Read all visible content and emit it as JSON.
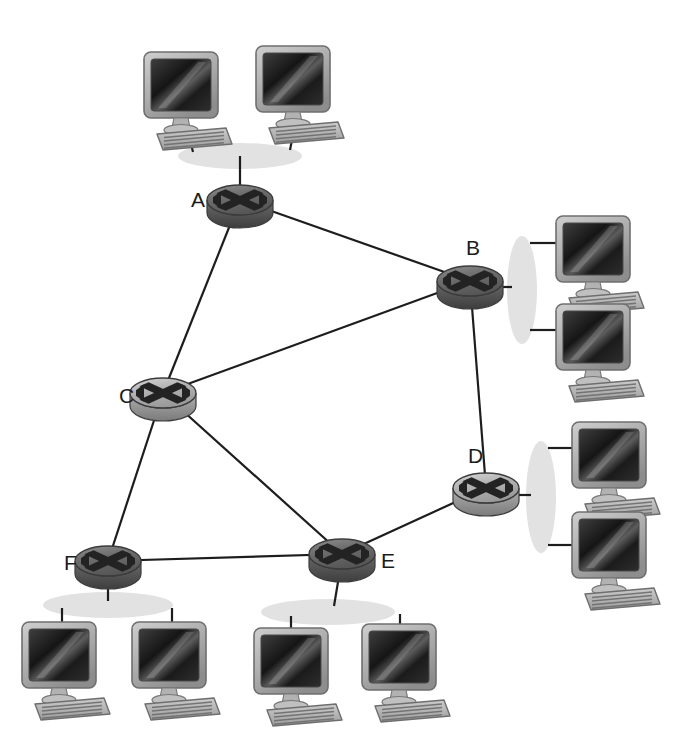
{
  "diagram": {
    "type": "network-topology",
    "background_color": "#ffffff",
    "link_color": "#1d1d1d",
    "link_width": 2.2,
    "label_color": "#1c1c1c",
    "label_font_size": 21,
    "router": {
      "icon_name": "router-icon",
      "top_fill_light": "#c9c9c9",
      "top_fill_dark": "#6f6f6f",
      "side_fill": "#5a5a5a",
      "edge_stroke": "#3b3b3b",
      "cross_color": "#232323",
      "rx": 33,
      "ry": 15,
      "body_height": 13
    },
    "lan": {
      "icon_name": "lan-segment-ellipse",
      "fill": "#e2e2e2",
      "stroke": "none"
    },
    "computer": {
      "icon_name": "desktop-computer-icon",
      "screen_dark": "#1a1a1a",
      "screen_light": "#4a4a4a",
      "bezel": "#b8b8b8",
      "bezel_edge": "#7d7d7d",
      "keyboard": "#bdbdbd",
      "keyboard_line": "#6a6a6a",
      "stand": "#a8a8a8"
    }
  },
  "routers": [
    {
      "id": "A",
      "label": "A",
      "cx": 240,
      "cy": 200,
      "label_x": 191,
      "label_y": 207,
      "tone": "dark"
    },
    {
      "id": "B",
      "label": "B",
      "cx": 470,
      "cy": 281,
      "label_x": 466,
      "label_y": 255,
      "tone": "dark"
    },
    {
      "id": "C",
      "label": "C",
      "cx": 163,
      "cy": 393,
      "label_x": 119,
      "label_y": 403,
      "tone": "light"
    },
    {
      "id": "D",
      "label": "D",
      "cx": 486,
      "cy": 488,
      "label_x": 468,
      "label_y": 463,
      "tone": "light"
    },
    {
      "id": "E",
      "label": "E",
      "cx": 342,
      "cy": 554,
      "label_x": 381,
      "label_y": 568,
      "tone": "dark"
    },
    {
      "id": "F",
      "label": "F",
      "cx": 108,
      "cy": 561,
      "label_x": 64,
      "label_y": 570,
      "tone": "dark"
    }
  ],
  "links": [
    {
      "from": "A",
      "to": "B",
      "name": "link-a-b"
    },
    {
      "from": "A",
      "to": "C",
      "name": "link-a-c"
    },
    {
      "from": "C",
      "to": "B",
      "name": "link-c-b"
    },
    {
      "from": "C",
      "to": "F",
      "name": "link-c-f"
    },
    {
      "from": "C",
      "to": "E",
      "name": "link-c-e"
    },
    {
      "from": "F",
      "to": "E",
      "name": "link-f-e"
    },
    {
      "from": "E",
      "to": "D",
      "name": "link-e-d"
    },
    {
      "from": "D",
      "to": "B",
      "name": "link-d-b"
    }
  ],
  "lan_segments": [
    {
      "id": "lan-a",
      "attached_router": "A",
      "orientation": "horizontal",
      "cx": 240,
      "cy": 156,
      "rx": 62,
      "ry": 13,
      "router_stub": {
        "x1": 240,
        "y1": 156,
        "x2": 240,
        "y2": 186
      },
      "hosts": [
        {
          "id": "pc-a-1",
          "x": 140,
          "y": 48,
          "stub": {
            "x1": 185,
            "y1": 120,
            "x2": 193,
            "y2": 152
          }
        },
        {
          "id": "pc-a-2",
          "x": 252,
          "y": 42,
          "stub": {
            "x1": 297,
            "y1": 114,
            "x2": 290,
            "y2": 150
          }
        }
      ]
    },
    {
      "id": "lan-b",
      "attached_router": "B",
      "orientation": "vertical",
      "cx": 522,
      "cy": 290,
      "rx": 15,
      "ry": 54,
      "router_stub": {
        "x1": 503,
        "y1": 287,
        "x2": 512,
        "y2": 287
      },
      "hosts": [
        {
          "id": "pc-b-1",
          "x": 552,
          "y": 212,
          "stub": {
            "x1": 530,
            "y1": 243,
            "x2": 556,
            "y2": 243
          }
        },
        {
          "id": "pc-b-2",
          "x": 552,
          "y": 300,
          "stub": {
            "x1": 530,
            "y1": 330,
            "x2": 556,
            "y2": 330
          }
        }
      ]
    },
    {
      "id": "lan-d",
      "attached_router": "D",
      "orientation": "vertical",
      "cx": 541,
      "cy": 497,
      "rx": 15,
      "ry": 56,
      "router_stub": {
        "x1": 519,
        "y1": 495,
        "x2": 531,
        "y2": 495
      },
      "hosts": [
        {
          "id": "pc-d-1",
          "x": 568,
          "y": 418,
          "stub": {
            "x1": 548,
            "y1": 448,
            "x2": 574,
            "y2": 448
          }
        },
        {
          "id": "pc-d-2",
          "x": 568,
          "y": 508,
          "stub": {
            "x1": 548,
            "y1": 545,
            "x2": 574,
            "y2": 545
          }
        }
      ]
    },
    {
      "id": "lan-f",
      "attached_router": "F",
      "orientation": "horizontal",
      "cx": 108,
      "cy": 605,
      "rx": 65,
      "ry": 13,
      "router_stub": {
        "x1": 108,
        "y1": 575,
        "x2": 108,
        "y2": 601
      },
      "hosts": [
        {
          "id": "pc-f-1",
          "x": 18,
          "y": 618,
          "stub": {
            "x1": 62,
            "y1": 608,
            "x2": 62,
            "y2": 628
          }
        },
        {
          "id": "pc-f-2",
          "x": 128,
          "y": 618,
          "stub": {
            "x1": 172,
            "y1": 608,
            "x2": 172,
            "y2": 628
          }
        }
      ]
    },
    {
      "id": "lan-e",
      "attached_router": "E",
      "orientation": "horizontal",
      "cx": 328,
      "cy": 612,
      "rx": 67,
      "ry": 13,
      "router_stub": {
        "x1": 340,
        "y1": 570,
        "x2": 334,
        "y2": 606
      },
      "hosts": [
        {
          "id": "pc-e-1",
          "x": 250,
          "y": 624,
          "stub": {
            "x1": 291,
            "y1": 616,
            "x2": 291,
            "y2": 634
          }
        },
        {
          "id": "pc-e-2",
          "x": 358,
          "y": 620,
          "stub": {
            "x1": 400,
            "y1": 614,
            "x2": 400,
            "y2": 630
          }
        }
      ]
    }
  ]
}
